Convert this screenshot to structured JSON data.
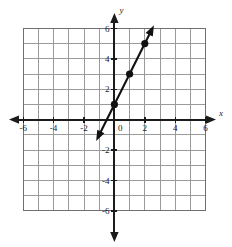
{
  "figure": {
    "title": "",
    "background_color": "#ffffff"
  },
  "axes": {
    "x_name": "x",
    "y_name": "y",
    "origin_label": "0",
    "x_tick_labels": [
      "-6",
      "-4",
      "-2",
      "2",
      "4",
      "6"
    ],
    "x_tick_values": [
      -6,
      -4,
      -2,
      2,
      4,
      6
    ],
    "y_tick_labels": [
      "6",
      "4",
      "2",
      "-2",
      "-4",
      "-6"
    ],
    "y_tick_values": [
      6,
      4,
      2,
      -2,
      -4,
      -6
    ],
    "grid_color": "#9a9a9a",
    "axis_color": "#1b1b1b"
  },
  "chart_data": {
    "type": "line",
    "title": "",
    "xlabel": "x",
    "ylabel": "y",
    "xlim": [
      -6,
      6
    ],
    "ylim": [
      -6,
      6
    ],
    "grid": true,
    "legend": "none",
    "equation": "y = 2x + 1",
    "slope": 2,
    "y_intercept": 1,
    "series": [
      {
        "name": "y = 2x + 1",
        "color": "#111111",
        "arrows_both_ends": true,
        "marked_points": [
          {
            "x": 0,
            "y": 1
          },
          {
            "x": 1,
            "y": 3
          },
          {
            "x": 2,
            "y": 5
          }
        ],
        "x": [
          -1.2,
          2.6
        ],
        "values": [
          -1.4,
          6.2
        ]
      }
    ]
  }
}
